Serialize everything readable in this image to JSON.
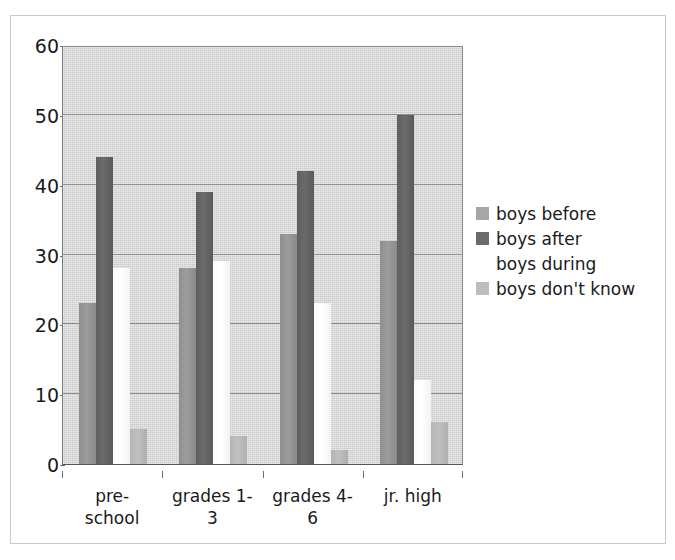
{
  "chart_data": {
    "type": "bar",
    "title": "",
    "subtitle": "",
    "xlabel": "",
    "ylabel": "",
    "ylim": [
      0,
      60
    ],
    "ytick_step": 10,
    "ytick_labels": [
      "0",
      "10",
      "20",
      "30",
      "40",
      "50",
      "60"
    ],
    "grid": true,
    "grid_axis": "y",
    "legend_position": "right",
    "categories": [
      "pre-school",
      "grades 1-3",
      "grades 4-6",
      "jr. high"
    ],
    "category_label_lines": [
      [
        "pre-",
        "school"
      ],
      [
        "grades 1-",
        "3"
      ],
      [
        "grades 4-",
        "6"
      ],
      [
        "jr. high",
        ""
      ]
    ],
    "series": [
      {
        "name": "boys before",
        "color": "#a6a6a6",
        "values": [
          23,
          28,
          33,
          32
        ]
      },
      {
        "name": "boys after",
        "color": "#6b6b6b",
        "values": [
          44,
          39,
          42,
          50
        ]
      },
      {
        "name": "boys during",
        "color": "#ffffff",
        "values": [
          28,
          29,
          23,
          12
        ]
      },
      {
        "name": "boys don't know",
        "color": "#bdbdbd",
        "values": [
          5,
          4,
          2,
          6
        ]
      }
    ]
  },
  "legend": {
    "entries": [
      {
        "label": "boys before"
      },
      {
        "label": "boys after"
      },
      {
        "label": "boys during"
      },
      {
        "label": "boys don't know"
      }
    ]
  },
  "axes": {
    "y": {
      "ticks": [
        "60",
        "50",
        "40",
        "30",
        "20",
        "10",
        "0"
      ]
    },
    "x": {
      "ticks": [
        "pre-school",
        "grades 1-3",
        "grades 4-6",
        "jr. high"
      ]
    }
  },
  "colors": {
    "plot_background": "#d6d6d6",
    "gridline": "#8e8e8e",
    "frame_border": "#c8c8c8",
    "text": "#1a1a1a"
  }
}
